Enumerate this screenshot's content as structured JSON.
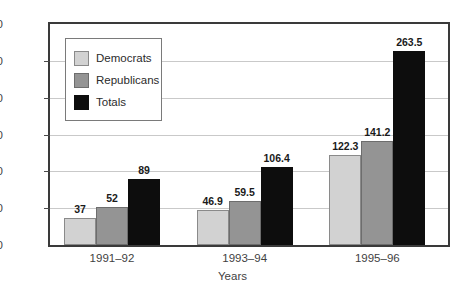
{
  "chart_data": {
    "type": "bar",
    "title": "",
    "subtitle": "",
    "xlabel": "Years",
    "ylabel": "",
    "categories": [
      "1991–92",
      "1993–94",
      "1995–96"
    ],
    "series": [
      {
        "name": "Democrats",
        "color": "#d2d2d2",
        "values": [
          37,
          46.9,
          122.3
        ],
        "labels": [
          "37",
          "46.9",
          "122.3"
        ]
      },
      {
        "name": "Republicans",
        "color": "#949494",
        "values": [
          52,
          59.5,
          141.2
        ],
        "labels": [
          "52",
          "59.5",
          "141.2"
        ]
      },
      {
        "name": "Totals",
        "color": "#0d0d0d",
        "values": [
          89,
          106.4,
          263.5
        ],
        "labels": [
          "89",
          "106.4",
          "263.5"
        ]
      }
    ],
    "ylim": [
      0,
      300
    ],
    "ytick_values": [
      0,
      50,
      100,
      150,
      200,
      250,
      300
    ],
    "ytick_labels": [
      "0",
      "50",
      "100",
      "150",
      "200",
      "250",
      "$300"
    ],
    "grid": true,
    "legend_position": "inside-top-left",
    "axis_border_color": "#3a3a3a",
    "gridline_color": "#c9c9c9",
    "label_text_color": "#3f3f3f",
    "value_label_color": "#1a1a1a"
  }
}
